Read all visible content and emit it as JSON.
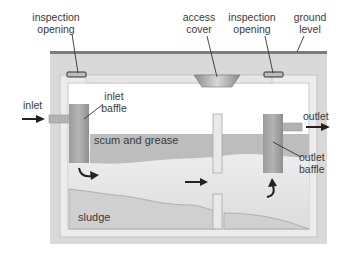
{
  "diagram": {
    "labels": {
      "inspection_opening_left": [
        "inspection",
        "opening"
      ],
      "access_cover": [
        "access",
        "cover"
      ],
      "inspection_opening_right": [
        "inspection",
        "opening"
      ],
      "ground_level": [
        "ground",
        "level"
      ],
      "inlet": "inlet",
      "inlet_baffle": [
        "inlet",
        "baffle"
      ],
      "outlet": "outlet",
      "outlet_baffle": [
        "outlet",
        "baffle"
      ],
      "scum_and_grease": "scum and grease",
      "sludge": "sludge"
    },
    "colors": {
      "ground": "#d6d6d6",
      "ground_line": "#7a7a7a",
      "tank_wall": "#e6e6e6",
      "liquid": "#e2e2e2",
      "scum": "#b9b9b9",
      "sludge": "#cfcfcf",
      "baffle": "#a8a8a8",
      "arrow": "#222222"
    }
  }
}
